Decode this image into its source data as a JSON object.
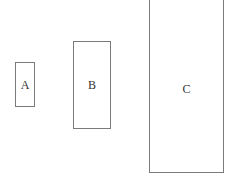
{
  "diagram": {
    "type": "size-comparison-rectangles",
    "shapes": [
      {
        "id": "A",
        "label": "A",
        "width_rel": 1,
        "height_rel": 1
      },
      {
        "id": "B",
        "label": "B",
        "width_rel": 1.9,
        "height_rel": 1.96
      },
      {
        "id": "C",
        "label": "C",
        "width_rel": 3.75,
        "height_rel": 3.9
      }
    ],
    "colors": {
      "border": "#7a7a7a",
      "text": "#333333",
      "background": "#ffffff"
    }
  }
}
